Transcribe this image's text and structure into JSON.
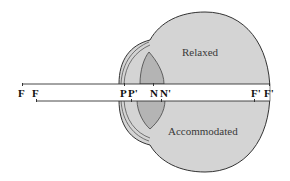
{
  "diagram": {
    "colors": {
      "background": "#ffffff",
      "eyeball_fill": "#d4d4d4",
      "lens_fill": "#b4b4b4",
      "outline": "#333333",
      "axis_band": "#ffffff"
    },
    "states": {
      "top_label": "Relaxed",
      "bottom_label": "Accommodated"
    },
    "markers": [
      {
        "id": "F-accommodated",
        "text": "F",
        "x": 22
      },
      {
        "id": "F-relaxed",
        "text": "F",
        "x": 36
      },
      {
        "id": "P-accommodated",
        "text": "P",
        "x": 123
      },
      {
        "id": "P-prime",
        "text": "P'",
        "x": 132
      },
      {
        "id": "N",
        "text": "N",
        "x": 154
      },
      {
        "id": "N-prime",
        "text": "N'",
        "x": 163
      },
      {
        "id": "F-prime-accommodated",
        "text": "F'",
        "x": 254
      },
      {
        "id": "F-prime-relaxed",
        "text": "F'",
        "x": 266
      }
    ]
  }
}
